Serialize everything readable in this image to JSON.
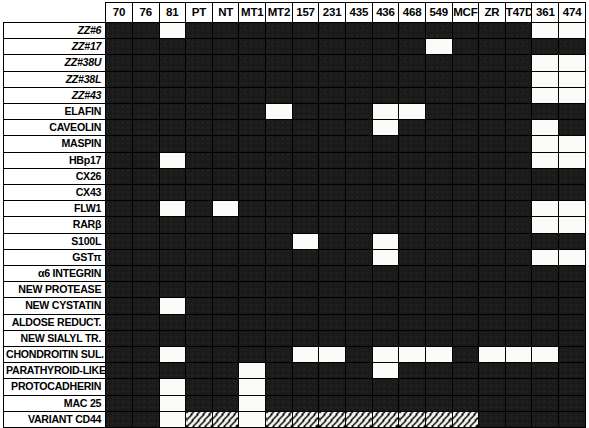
{
  "figure": {
    "legend": {
      "expressed_fill": "#1a1a1a",
      "absent_fill": "#fbfbf7",
      "not_determined_fill": "hatched"
    }
  },
  "columns": [
    {
      "label": "70"
    },
    {
      "label": "76"
    },
    {
      "label": "81"
    },
    {
      "label": "PT"
    },
    {
      "label": "NT"
    },
    {
      "label": "MT1"
    },
    {
      "label": "MT2"
    },
    {
      "label": "157"
    },
    {
      "label": "231"
    },
    {
      "label": "435"
    },
    {
      "label": "436"
    },
    {
      "label": "468"
    },
    {
      "label": "549"
    },
    {
      "label": "MCF"
    },
    {
      "label": "ZR"
    },
    {
      "label": "T47D"
    },
    {
      "label": "361"
    },
    {
      "label": "474"
    }
  ],
  "rows": [
    {
      "label": "ZZ#6",
      "italic": true,
      "cells": [
        "dark",
        "dark",
        "light",
        "dark",
        "dark",
        "dark",
        "dark",
        "dark",
        "dark",
        "dark",
        "dark",
        "dark",
        "dark",
        "dark",
        "dark",
        "dark",
        "light",
        "light"
      ]
    },
    {
      "label": "ZZ#17",
      "italic": true,
      "cells": [
        "dark",
        "dark",
        "dark",
        "dark",
        "dark",
        "dark",
        "dark",
        "dark",
        "dark",
        "dark",
        "dark",
        "dark",
        "light",
        "dark",
        "dark",
        "dark",
        "dark",
        "dark"
      ]
    },
    {
      "label": "ZZ#38U",
      "italic": true,
      "cells": [
        "dark",
        "dark",
        "dark",
        "dark",
        "dark",
        "dark",
        "dark",
        "dark",
        "dark",
        "dark",
        "dark",
        "dark",
        "dark",
        "dark",
        "dark",
        "dark",
        "light",
        "light"
      ]
    },
    {
      "label": "ZZ#38L",
      "italic": true,
      "cells": [
        "dark",
        "dark",
        "dark",
        "dark",
        "dark",
        "dark",
        "dark",
        "dark",
        "dark",
        "dark",
        "dark",
        "dark",
        "dark",
        "dark",
        "dark",
        "dark",
        "light",
        "light"
      ]
    },
    {
      "label": "ZZ#43",
      "italic": true,
      "cells": [
        "dark",
        "dark",
        "dark",
        "dark",
        "dark",
        "dark",
        "dark",
        "dark",
        "dark",
        "dark",
        "dark",
        "dark",
        "dark",
        "dark",
        "dark",
        "dark",
        "light",
        "light"
      ]
    },
    {
      "label": "ELAFIN",
      "italic": false,
      "cells": [
        "dark",
        "dark",
        "dark",
        "dark",
        "dark",
        "dark",
        "light",
        "dark",
        "dark",
        "dark",
        "light",
        "light",
        "dark",
        "dark",
        "dark",
        "dark",
        "dark",
        "dark"
      ]
    },
    {
      "label": "CAVEOLIN",
      "italic": false,
      "cells": [
        "dark",
        "dark",
        "dark",
        "dark",
        "dark",
        "dark",
        "dark",
        "dark",
        "dark",
        "dark",
        "light",
        "dark",
        "dark",
        "dark",
        "dark",
        "dark",
        "light",
        "dark"
      ]
    },
    {
      "label": "MASPIN",
      "italic": false,
      "cells": [
        "dark",
        "dark",
        "dark",
        "dark",
        "dark",
        "dark",
        "dark",
        "dark",
        "dark",
        "dark",
        "dark",
        "dark",
        "dark",
        "dark",
        "dark",
        "dark",
        "light",
        "light"
      ]
    },
    {
      "label": "HBp17",
      "italic": false,
      "cells": [
        "dark",
        "dark",
        "light",
        "dark",
        "dark",
        "dark",
        "dark",
        "dark",
        "dark",
        "dark",
        "dark",
        "dark",
        "dark",
        "dark",
        "dark",
        "dark",
        "light",
        "light"
      ]
    },
    {
      "label": "CX26",
      "italic": false,
      "cells": [
        "dark",
        "dark",
        "dark",
        "dark",
        "dark",
        "dark",
        "dark",
        "dark",
        "dark",
        "dark",
        "dark",
        "dark",
        "dark",
        "dark",
        "dark",
        "dark",
        "dark",
        "dark"
      ]
    },
    {
      "label": "CX43",
      "italic": false,
      "cells": [
        "dark",
        "dark",
        "dark",
        "dark",
        "dark",
        "dark",
        "dark",
        "dark",
        "dark",
        "dark",
        "dark",
        "dark",
        "dark",
        "dark",
        "dark",
        "dark",
        "dark",
        "dark"
      ]
    },
    {
      "label": "FLW1",
      "italic": false,
      "cells": [
        "dark",
        "dark",
        "light",
        "dark",
        "light",
        "dark",
        "dark",
        "dark",
        "dark",
        "dark",
        "dark",
        "dark",
        "dark",
        "dark",
        "dark",
        "dark",
        "light",
        "light"
      ]
    },
    {
      "label": "RARβ",
      "italic": false,
      "cells": [
        "dark",
        "dark",
        "dark",
        "dark",
        "dark",
        "dark",
        "dark",
        "dark",
        "dark",
        "dark",
        "dark",
        "dark",
        "dark",
        "dark",
        "dark",
        "dark",
        "light",
        "light"
      ]
    },
    {
      "label": "S100L",
      "italic": false,
      "cells": [
        "dark",
        "dark",
        "dark",
        "dark",
        "dark",
        "dark",
        "dark",
        "light",
        "dark",
        "dark",
        "light",
        "dark",
        "dark",
        "dark",
        "dark",
        "dark",
        "dark",
        "dark"
      ]
    },
    {
      "label": "GSTπ",
      "italic": false,
      "cells": [
        "dark",
        "dark",
        "dark",
        "dark",
        "dark",
        "dark",
        "dark",
        "dark",
        "dark",
        "dark",
        "light",
        "dark",
        "dark",
        "dark",
        "dark",
        "dark",
        "light",
        "light"
      ]
    },
    {
      "label": "α6 INTEGRIN",
      "italic": false,
      "cells": [
        "dark",
        "dark",
        "dark",
        "dark",
        "dark",
        "dark",
        "dark",
        "dark",
        "dark",
        "dark",
        "dark",
        "dark",
        "dark",
        "dark",
        "dark",
        "dark",
        "dark",
        "dark"
      ]
    },
    {
      "label": "NEW PROTEASE",
      "italic": false,
      "cells": [
        "dark",
        "dark",
        "dark",
        "dark",
        "dark",
        "dark",
        "dark",
        "dark",
        "dark",
        "dark",
        "dark",
        "dark",
        "dark",
        "dark",
        "dark",
        "dark",
        "dark",
        "dark"
      ]
    },
    {
      "label": "NEW CYSTATIN",
      "italic": false,
      "cells": [
        "dark",
        "dark",
        "light",
        "dark",
        "dark",
        "dark",
        "dark",
        "dark",
        "dark",
        "dark",
        "dark",
        "dark",
        "dark",
        "dark",
        "dark",
        "dark",
        "dark",
        "dark"
      ]
    },
    {
      "label": "ALDOSE REDUCT.",
      "italic": false,
      "cells": [
        "dark",
        "dark",
        "dark",
        "dark",
        "dark",
        "dark",
        "dark",
        "dark",
        "dark",
        "dark",
        "dark",
        "dark",
        "dark",
        "dark",
        "dark",
        "dark",
        "dark",
        "dark"
      ]
    },
    {
      "label": "NEW SIALYL TR.",
      "italic": false,
      "cells": [
        "dark",
        "dark",
        "dark",
        "dark",
        "dark",
        "dark",
        "dark",
        "dark",
        "dark",
        "dark",
        "dark",
        "dark",
        "dark",
        "dark",
        "dark",
        "dark",
        "dark",
        "dark"
      ]
    },
    {
      "label": "CHONDROITIN SUL.",
      "italic": false,
      "cells": [
        "dark",
        "dark",
        "light",
        "dark",
        "dark",
        "dark",
        "dark",
        "light",
        "light",
        "dark",
        "light",
        "light",
        "light",
        "dark",
        "light",
        "light",
        "light",
        "dark"
      ]
    },
    {
      "label": "PARATHYROID-LIKE",
      "italic": false,
      "cells": [
        "dark",
        "dark",
        "dark",
        "dark",
        "dark",
        "light",
        "dark",
        "dark",
        "dark",
        "dark",
        "light",
        "dark",
        "dark",
        "dark",
        "dark",
        "dark",
        "dark",
        "dark"
      ]
    },
    {
      "label": "PROTOCADHERIN",
      "italic": false,
      "cells": [
        "dark",
        "dark",
        "light",
        "dark",
        "dark",
        "light",
        "dark",
        "dark",
        "dark",
        "dark",
        "dark",
        "dark",
        "dark",
        "dark",
        "dark",
        "dark",
        "dark",
        "dark"
      ]
    },
    {
      "label": "MAC 25",
      "italic": false,
      "cells": [
        "dark",
        "dark",
        "light",
        "dark",
        "dark",
        "light",
        "dark",
        "dark",
        "dark",
        "dark",
        "dark",
        "dark",
        "dark",
        "dark",
        "dark",
        "dark",
        "dark",
        "dark"
      ]
    },
    {
      "label": "VARIANT CD44",
      "italic": false,
      "cells": [
        "dark",
        "dark",
        "light",
        "hatch",
        "hatch",
        "light",
        "hatch",
        "hatch",
        "hatch",
        "hatch",
        "hatch",
        "hatch",
        "hatch",
        "hatch",
        "dark",
        "dark",
        "dark",
        "dark"
      ]
    }
  ]
}
